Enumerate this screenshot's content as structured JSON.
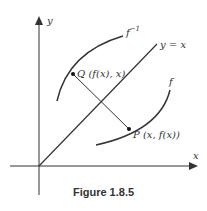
{
  "figure": {
    "caption": "Figure 1.8.5",
    "axes": {
      "x_label": "x",
      "y_label": "y"
    },
    "line_label": "y = x",
    "curve_f_label": "f",
    "curve_finv_label": "f",
    "curve_finv_superscript": "−1",
    "point_q_label": "Q (f(x), x)",
    "point_p_label": "P (x, f(x))"
  },
  "colors": {
    "stroke": "#333333",
    "background": "#ffffff"
  }
}
